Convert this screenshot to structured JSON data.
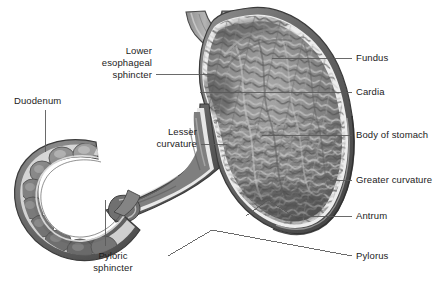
{
  "figure": {
    "background_color": "#ffffff",
    "text_color": "#1c1c1c",
    "leader_line_color": "#5a5a5a",
    "palette": {
      "serosa_outer": "#6f6f6f",
      "muscularis_dark": "#4a4a4a",
      "submucosa_light": "#ededed",
      "mucosa_mid": "#8a8a8a",
      "rugae_light": "#bdbdbd",
      "rugae_dark": "#555555",
      "lumen_shadow": "#3d3d3d",
      "highlight": "#d8d8d8"
    }
  },
  "labels": {
    "lower_esophageal_sphincter": {
      "lines": [
        "Lower",
        "esophageal",
        "sphincter"
      ],
      "side": "left",
      "text_right_x": 152,
      "first_line_y": 45,
      "leader": {
        "x1": 156,
        "y1": 74,
        "x2": 214,
        "y2": 74
      }
    },
    "duodenum": {
      "lines": [
        "Duodenum"
      ],
      "side": "left",
      "text_left_x": 14,
      "first_line_y": 95,
      "leader": {
        "x1": 45,
        "y1": 110,
        "x2": 45,
        "y2": 152
      }
    },
    "lesser_curvature": {
      "lines": [
        "Lesser",
        "curvature"
      ],
      "side": "left",
      "text_right_x": 197,
      "first_line_y": 126,
      "leader": {
        "x1": 201,
        "y1": 144,
        "x2": 227,
        "y2": 144
      }
    },
    "pyloric_sphincter": {
      "lines": [
        "Pyloric",
        "sphincter"
      ],
      "side": "center",
      "text_center_x": 113,
      "first_line_y": 250,
      "leader": {
        "x1": 105,
        "y1": 200,
        "x2": 105,
        "y2": 246
      }
    },
    "fundus": {
      "lines": [
        "Fundus"
      ],
      "side": "right",
      "text_left_x": 356,
      "first_line_y": 52,
      "leader": {
        "x1": 272,
        "y1": 58,
        "x2": 352,
        "y2": 58
      }
    },
    "cardia": {
      "lines": [
        "Cardia"
      ],
      "side": "right",
      "text_left_x": 356,
      "first_line_y": 86,
      "leader": {
        "x1": 200,
        "y1": 92,
        "x2": 352,
        "y2": 92
      }
    },
    "body_of_stomach": {
      "lines": [
        "Body of stomach"
      ],
      "side": "right",
      "text_left_x": 356,
      "first_line_y": 129,
      "leader": {
        "x1": 262,
        "y1": 135,
        "x2": 352,
        "y2": 135
      }
    },
    "greater_curvature": {
      "lines": [
        "Greater curvature"
      ],
      "side": "right",
      "text_left_x": 356,
      "first_line_y": 174,
      "leader": {
        "x1": 330,
        "y1": 180,
        "x2": 352,
        "y2": 180
      }
    },
    "antrum": {
      "lines": [
        "Antrum"
      ],
      "side": "right",
      "text_left_x": 356,
      "first_line_y": 210,
      "leader": {
        "x1": 246,
        "y1": 216,
        "x2": 352,
        "y2": 216
      }
    },
    "pylorus": {
      "lines": [
        "Pylorus"
      ],
      "side": "right",
      "text_left_x": 356,
      "first_line_y": 250,
      "leader": {
        "x1": 168,
        "y1": 256,
        "x2": 352,
        "y2": 256
      }
    }
  },
  "structures": [
    {
      "name": "esophagus",
      "description": "tubular inlet entering the stomach at upper left of the organ"
    },
    {
      "name": "fundus",
      "description": "domed upper-left chamber of the stomach"
    },
    {
      "name": "cardia",
      "description": "region surrounding the esophageal opening"
    },
    {
      "name": "body-of-stomach",
      "description": "large central chamber lined with rugae"
    },
    {
      "name": "greater-curvature",
      "description": "long convex outer right/lower border"
    },
    {
      "name": "lesser-curvature",
      "description": "short concave inner upper-left border"
    },
    {
      "name": "antrum",
      "description": "narrowing lower portion of the stomach"
    },
    {
      "name": "pylorus",
      "description": "outlet channel at the bottom leading to the duodenum"
    },
    {
      "name": "pyloric-sphincter",
      "description": "muscular ring at the stomach outlet"
    },
    {
      "name": "duodenum",
      "description": "C-shaped segmented first portion of small intestine at left"
    }
  ]
}
